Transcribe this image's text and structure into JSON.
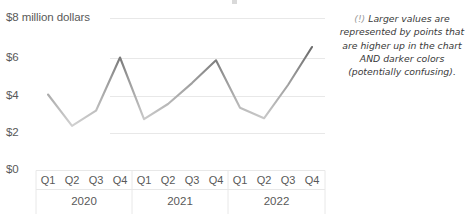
{
  "chart_data": {
    "type": "line",
    "title": "",
    "xlabel": "",
    "ylabel": "$8 million dollars",
    "ylim": [
      0,
      8
    ],
    "yticks": [
      0,
      2,
      4,
      6,
      8
    ],
    "ytick_labels": [
      "$0",
      "$2",
      "$4",
      "$6",
      "$8 million dollars"
    ],
    "grid": true,
    "legend": "none",
    "categories": [
      "Q1",
      "Q2",
      "Q3",
      "Q4",
      "Q1",
      "Q2",
      "Q3",
      "Q4",
      "Q1",
      "Q2",
      "Q3",
      "Q4"
    ],
    "groups": [
      "2020",
      "2021",
      "2022"
    ],
    "series": [
      {
        "name": "Revenue",
        "values": [
          4.0,
          2.35,
          3.15,
          5.95,
          2.7,
          3.5,
          4.6,
          5.8,
          3.3,
          2.75,
          4.5,
          6.5
        ]
      }
    ],
    "color_encoding": {
      "description": "line segment color darkens as value increases",
      "light": "#e2e2e2",
      "dark": "#6e6e6e"
    }
  },
  "axis": {
    "y_labels": [
      {
        "text": "$8 million dollars",
        "value": 8
      },
      {
        "text": "$6",
        "value": 6
      },
      {
        "text": "$4",
        "value": 4
      },
      {
        "text": "$2",
        "value": 2
      },
      {
        "text": "$0",
        "value": 0
      }
    ],
    "x_quarters": [
      "Q1",
      "Q2",
      "Q3",
      "Q4",
      "Q1",
      "Q2",
      "Q3",
      "Q4",
      "Q1",
      "Q2",
      "Q3",
      "Q4"
    ],
    "x_years": [
      "2020",
      "2021",
      "2022"
    ]
  },
  "annotation": {
    "marker": "(!)",
    "text": "Larger values are represented by points that are higher up in the chart AND darker colors (potentially confusing)."
  },
  "colors": {
    "gridline": "#e8e8e8",
    "axis_text": "#595959",
    "annotation_text": "#3a3a3a",
    "background": "#ffffff"
  }
}
